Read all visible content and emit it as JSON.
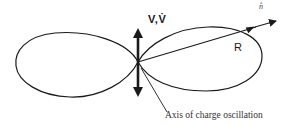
{
  "figure": {
    "type": "dipole-radiation-pattern",
    "labels": {
      "velocity": "V,V̇",
      "unit_vector": "n̂",
      "radius": "R",
      "axis_caption": "Axis of charge oscillation"
    },
    "colors": {
      "stroke": "#1a1a1a",
      "background": "#ffffff"
    }
  }
}
